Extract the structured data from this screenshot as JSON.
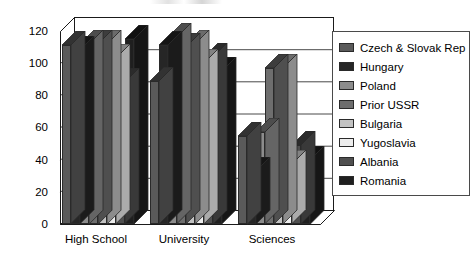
{
  "chart_data": {
    "type": "bar",
    "title": "",
    "subtitle": "",
    "xlabel": "",
    "ylabel": "",
    "categories": [
      "High School",
      "University",
      "Sciences"
    ],
    "ylim": [
      0,
      120
    ],
    "yticks": [
      0,
      20,
      40,
      60,
      80,
      100,
      120
    ],
    "ytick_labels": [
      "0",
      "20",
      "40",
      "60",
      "80",
      "100",
      "120"
    ],
    "grid": true,
    "grid_axis": "y",
    "legend_position": "right",
    "style": "3d-clustered-column",
    "series": [
      {
        "name": "Czech & Slovak Rep",
        "color": "#5a5a5a",
        "values": [
          111,
          89,
          55
        ]
      },
      {
        "name": "Hungary",
        "color": "#262626",
        "values": [
          108,
          111,
          33
        ]
      },
      {
        "name": "Poland",
        "color": "#8c8c8c",
        "values": [
          112,
          116,
          57
        ]
      },
      {
        "name": "Prior USSR",
        "color": "#6e6e6e",
        "values": [
          112,
          110,
          97
        ]
      },
      {
        "name": "Bulgaria",
        "color": "#c2c2c2",
        "values": [
          112,
          112,
          97
        ]
      },
      {
        "name": "Yugoslavia",
        "color": "#ededed",
        "values": [
          103,
          100,
          37
        ]
      },
      {
        "name": "Albania",
        "color": "#4f4f4f",
        "values": [
          88,
          104,
          49
        ]
      },
      {
        "name": "Romania",
        "color": "#1f1f1f",
        "values": [
          115,
          95,
          40
        ]
      }
    ]
  },
  "axes": {
    "y_tick_labels": [
      "120",
      "100",
      "80",
      "60",
      "40",
      "20",
      "0"
    ],
    "x_tick_labels": [
      "High School",
      "University",
      "Sciences"
    ]
  },
  "legend": {
    "items": [
      {
        "label": "Czech & Slovak Rep",
        "color": "#5a5a5a"
      },
      {
        "label": "Hungary",
        "color": "#262626"
      },
      {
        "label": "Poland",
        "color": "#8c8c8c"
      },
      {
        "label": "Prior USSR",
        "color": "#6e6e6e"
      },
      {
        "label": "Bulgaria",
        "color": "#c2c2c2"
      },
      {
        "label": "Yugoslavia",
        "color": "#ededed"
      },
      {
        "label": "Albania",
        "color": "#4f4f4f"
      },
      {
        "label": "Romania",
        "color": "#1f1f1f"
      }
    ]
  }
}
